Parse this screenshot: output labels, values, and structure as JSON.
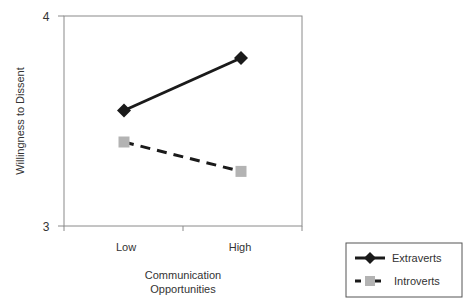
{
  "chart_data": {
    "type": "line",
    "title": "",
    "xlabel": "Communication Opportunities",
    "xlabel_lines": [
      "Communication",
      "Opportunities"
    ],
    "ylabel": "Willingness to Dissent",
    "categories": [
      "Low",
      "High"
    ],
    "ylim": [
      3,
      4
    ],
    "yticks": [
      "3",
      "4"
    ],
    "grid": false,
    "legend_position": "bottom-right",
    "series": [
      {
        "name": "Extraverts",
        "values": [
          3.55,
          3.8
        ],
        "color": "#1a1a1a",
        "line": "solid",
        "marker": "diamond"
      },
      {
        "name": "Introverts",
        "values": [
          3.4,
          3.26
        ],
        "color": "#1a1a1a",
        "marker_color": "#b3b3b3",
        "line": "dashed",
        "marker": "square"
      }
    ]
  }
}
